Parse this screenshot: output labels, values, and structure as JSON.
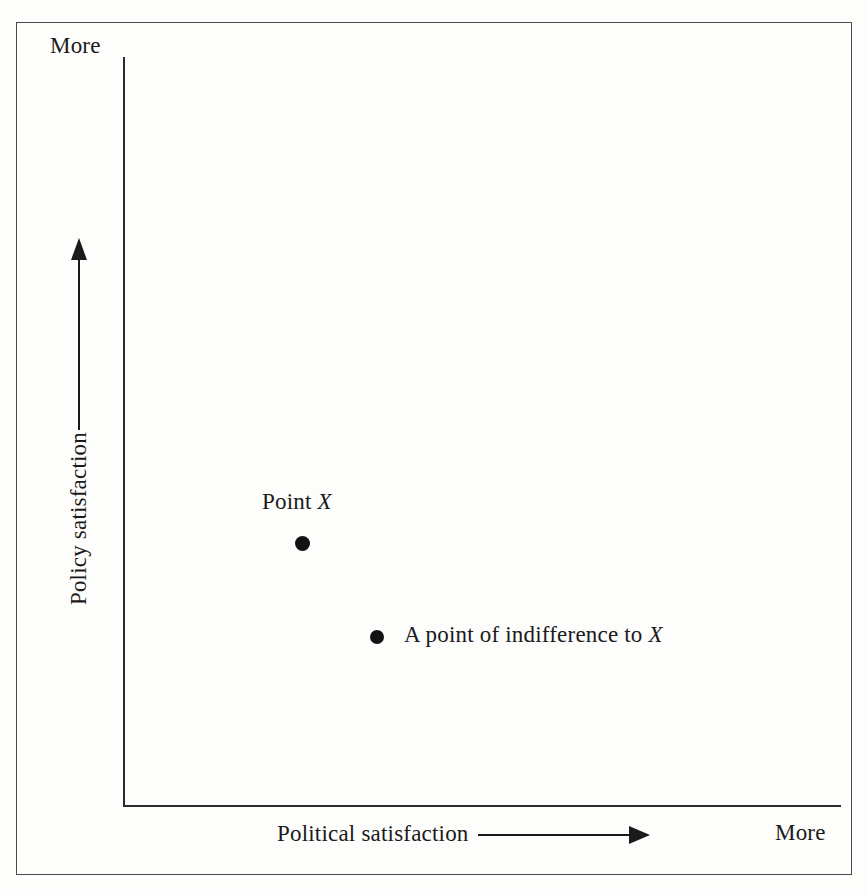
{
  "figure": {
    "axes": {
      "y": {
        "title": "Policy satisfaction",
        "extreme_label": "More",
        "arrow_direction": "up"
      },
      "x": {
        "title": "Political satisfaction",
        "extreme_label": "More",
        "arrow_direction": "right"
      }
    },
    "points": [
      {
        "id": "point-x",
        "label_prefix": "Point ",
        "label_variable": "X",
        "x_rel": 0.25,
        "y_rel": 0.35
      },
      {
        "id": "point-indifference",
        "label_prefix": "A point of indifference to ",
        "label_variable": "X",
        "x_rel": 0.35,
        "y_rel": 0.225
      }
    ],
    "colors": {
      "ink": "#1a1a1a",
      "axis": "#2b2b2b",
      "border": "#4a4a4a",
      "paper": "#fdfdfc",
      "marker": "#121212"
    }
  },
  "chart_data": {
    "type": "scatter",
    "title": "",
    "xlabel": "Political satisfaction",
    "ylabel": "Policy satisfaction",
    "xlim": [
      0,
      1
    ],
    "ylim": [
      0,
      1
    ],
    "grid": false,
    "legend": "none",
    "axis_tick_labels": {
      "x": [
        "More"
      ],
      "y": [
        "More"
      ]
    },
    "points": [
      {
        "label": "Point X",
        "x": 0.25,
        "y": 0.35
      },
      {
        "label": "A point of indifference to X",
        "x": 0.35,
        "y": 0.225
      }
    ],
    "annotations": [
      "Point X",
      "A point of indifference to X",
      "More",
      "More"
    ]
  }
}
